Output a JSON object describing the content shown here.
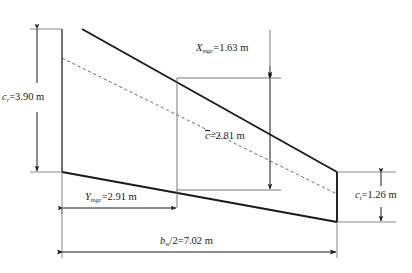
{
  "figure": {
    "type": "wing-planform-half-span",
    "units": "m"
  },
  "labels": {
    "root_chord": {
      "symbol": "c",
      "sub": "r",
      "text": "=3.90 m",
      "value": 3.9
    },
    "tip_chord": {
      "symbol": "c",
      "sub": "t",
      "text": "=1.26 m",
      "value": 1.26
    },
    "mac": {
      "symbol": "c",
      "sub": "",
      "text": "=2.81 m",
      "value": 2.81
    },
    "x_mgc": {
      "symbol": "X",
      "sub": "mgc",
      "text": "=1.63 m",
      "value": 1.63
    },
    "y_mgc": {
      "symbol": "Y",
      "sub": "mgc",
      "text": "=2.91 m",
      "value": 2.91
    },
    "semi_span": {
      "symbol": "b",
      "sub": "w",
      "text": "/2=7.02 m",
      "value": 7.02
    }
  },
  "colors": {
    "line": "#1a1a1a",
    "dim": "#2b2b2b",
    "background": "#ffffff"
  }
}
